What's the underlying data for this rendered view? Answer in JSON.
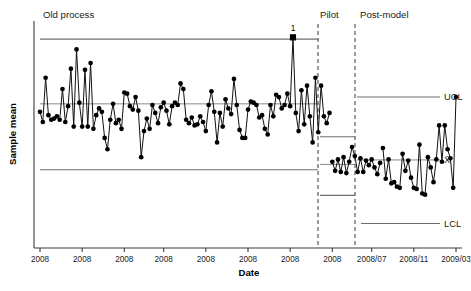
{
  "chart_data": {
    "type": "line",
    "title": "",
    "xlabel": "Date",
    "ylabel": "Sample mean",
    "grid": false,
    "legend_position": "right",
    "xlim": [
      0,
      148
    ],
    "ylim": [
      0,
      100
    ],
    "x_tick_labels": [
      "2008",
      "2008",
      "2008",
      "2008",
      "2008",
      "2008",
      "2008",
      "2008",
      "2008/07",
      "2008/11",
      "2009/03"
    ],
    "phases": [
      {
        "name": "Old process",
        "label": "Old process",
        "ucl": 92.0,
        "center": 63.5,
        "lcl": 34.5,
        "n": 104
      },
      {
        "name": "Pilot",
        "label": "Pilot",
        "ucl": 49.0,
        "center": 36.8,
        "lcl": 23.2,
        "n": 18
      },
      {
        "name": "Post-model",
        "label": "Post-model",
        "ucl": 66.5,
        "center": 38.8,
        "lcl": 10.8,
        "n": 26
      }
    ],
    "limit_labels": {
      "ucl": "UCL",
      "center": "X̄",
      "lcl": "LCL"
    },
    "annotations": [
      {
        "text": "1",
        "x_index": 90,
        "value": 92.8,
        "note": "point above UCL"
      }
    ],
    "series": [
      {
        "name": "Sample mean",
        "values": [
          60.0,
          55.5,
          75.0,
          58.5,
          56.5,
          57.0,
          58.0,
          56.5,
          70.0,
          55.5,
          62.5,
          79.0,
          53.5,
          87.5,
          64.0,
          53.5,
          78.5,
          53.5,
          81.5,
          52.5,
          58.5,
          61.5,
          60.0,
          48.5,
          43.5,
          56.5,
          63.5,
          55.0,
          56.5,
          52.5,
          68.5,
          68.0,
          62.5,
          61.0,
          66.5,
          60.5,
          40.0,
          51.5,
          57.0,
          52.5,
          63.0,
          59.5,
          55.0,
          62.0,
          64.0,
          60.5,
          54.5,
          62.5,
          64.0,
          63.0,
          72.5,
          70.0,
          56.5,
          55.0,
          57.5,
          54.0,
          54.5,
          58.0,
          55.5,
          51.5,
          63.0,
          69.0,
          60.0,
          46.5,
          59.5,
          53.5,
          65.5,
          61.5,
          59.0,
          74.5,
          63.0,
          52.0,
          48.5,
          48.5,
          61.0,
          64.5,
          64.0,
          63.0,
          57.5,
          58.5,
          52.5,
          50.0,
          63.0,
          58.0,
          67.5,
          66.5,
          61.5,
          63.0,
          68.0,
          62.5,
          92.8,
          59.5,
          51.5,
          69.5,
          54.5,
          71.5,
          58.0,
          46.5,
          75.0,
          51.0,
          71.5,
          58.0,
          55.0,
          59.5
        ]
      },
      {
        "name": "Pilot",
        "values": [
          38.0,
          34.0,
          39.0,
          33.5,
          40.0,
          33.0,
          38.0,
          44.5,
          40.5,
          33.5,
          39.5,
          33.5,
          38.5,
          36.5,
          39.0,
          35.5,
          32.5,
          37.5
        ]
      },
      {
        "name": "Post-model",
        "values": [
          44.0,
          30.5,
          39.0,
          28.5,
          29.0,
          27.0,
          26.5,
          41.5,
          34.0,
          38.5,
          31.0,
          26.5,
          26.0,
          45.5,
          24.0,
          23.5,
          40.0,
          35.5,
          29.0,
          39.0,
          54.0,
          38.0,
          54.0,
          43.5,
          39.5,
          26.5,
          66.5
        ]
      }
    ]
  },
  "axis": {
    "y_title": "Sample mean",
    "x_title": "Date"
  }
}
